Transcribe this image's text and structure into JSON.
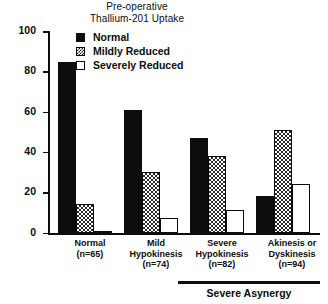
{
  "chart_data": {
    "type": "bar",
    "title": "Pre-operative Thallium-201 Uptake",
    "title_line1": "Pre-operative",
    "title_line2": "Thallium-201 Uptake",
    "xlabel": "",
    "ylabel": "",
    "ylim": [
      0,
      100
    ],
    "yticks": [
      0,
      20,
      40,
      60,
      80,
      100
    ],
    "grid": false,
    "legend_position": "top-center",
    "categories": [
      "Normal (n=65)",
      "Mild Hypokinesis (n=74)",
      "Severe Hypokinesis (n=82)",
      "Akinesis or Dyskinesis (n=94)"
    ],
    "series": [
      {
        "name": "Normal",
        "values": [
          85,
          61,
          47,
          18
        ]
      },
      {
        "name": "Mildly Reduced",
        "values": [
          14,
          30,
          38,
          51
        ]
      },
      {
        "name": "Severely Reduced",
        "values": [
          1,
          7,
          11,
          24
        ]
      }
    ],
    "annotations": [
      "Severe Asynergy"
    ]
  },
  "title": {
    "line1": "Pre-operative",
    "line2": "Thallium-201 Uptake"
  },
  "legend": {
    "items": [
      {
        "label": "Normal",
        "pattern": "solid",
        "color": "#0d0d0d"
      },
      {
        "label": "Mildly Reduced",
        "pattern": "hatch",
        "color": "#2a2a2a"
      },
      {
        "label": "Severely Reduced",
        "pattern": "open",
        "color": "#ffffff"
      }
    ]
  },
  "yaxis": {
    "ticks": [
      "100",
      "80",
      "60",
      "40",
      "20",
      "0"
    ]
  },
  "groups": [
    {
      "name_line1": "Normal",
      "name_line2": "(n=65)",
      "name_line3": "",
      "bars": {
        "normal": 85,
        "mild": 14,
        "severe": 1
      }
    },
    {
      "name_line1": "Mild",
      "name_line2": "Hypokinesis",
      "name_line3": "(n=74)",
      "bars": {
        "normal": 61,
        "mild": 30,
        "severe": 7
      }
    },
    {
      "name_line1": "Severe",
      "name_line2": "Hypokinesis",
      "name_line3": "(n=82)",
      "bars": {
        "normal": 47,
        "mild": 38,
        "severe": 11
      }
    },
    {
      "name_line1": "Akinesis or",
      "name_line2": "Dyskinesis",
      "name_line3": "(n=94)",
      "bars": {
        "normal": 18,
        "mild": 51,
        "severe": 24
      }
    }
  ],
  "bracket": {
    "label": "Severe Asynergy"
  }
}
